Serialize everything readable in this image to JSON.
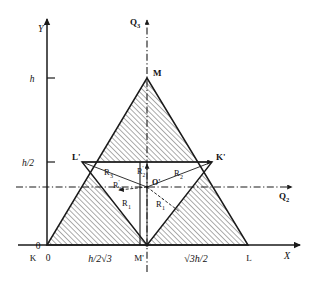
{
  "figure": {
    "name": "triangular-cross-section-geometry-diagram",
    "type": "geometric-diagram",
    "background": "#ffffff",
    "line_color": "#1a1a1a",
    "hatch_color": "#333333"
  },
  "axes": {
    "x": {
      "label": "X",
      "arrow": true,
      "y_pixel": 245,
      "from_x": 18,
      "to_x": 305
    },
    "y": {
      "label": "Y",
      "arrow": true,
      "x_pixel": 47,
      "from_y": 245,
      "to_y": 14
    },
    "origin_label": "0"
  },
  "dashdot_axes": [
    {
      "label": "Q2",
      "label_display": "Q",
      "sub": "2",
      "orientation": "horizontal",
      "pixel": 187,
      "arrow": true
    },
    {
      "label": "Q3",
      "label_display": "Q",
      "sub": "3",
      "orientation": "vertical",
      "pixel": 147,
      "arrow": true
    }
  ],
  "tick_labels": {
    "y": [
      {
        "text": "h",
        "y_pixel": 78
      },
      {
        "text": "h/2",
        "y_pixel": 162
      },
      {
        "text": "0",
        "y_pixel": 245
      }
    ],
    "x": [
      {
        "text": "K",
        "x_pixel": 33
      },
      {
        "text": "0",
        "x_pixel": 47
      },
      {
        "text": "h/2√3",
        "x_pixel": 100
      },
      {
        "text": "M'",
        "x_pixel": 139
      },
      {
        "text": "√3h/2",
        "x_pixel": 196
      },
      {
        "text": "L",
        "x_pixel": 249
      },
      {
        "text": "X",
        "x_pixel": 288
      }
    ]
  },
  "points": [
    {
      "name": "K",
      "label": "K",
      "x": 47,
      "y": 245
    },
    {
      "name": "L",
      "label": "L",
      "x": 248,
      "y": 245
    },
    {
      "name": "M",
      "label": "M",
      "x": 147,
      "y": 78
    },
    {
      "name": "Lp",
      "label": "L'",
      "x": 82,
      "y": 162
    },
    {
      "name": "Kp",
      "label": "K'",
      "x": 212,
      "y": 162
    },
    {
      "name": "Mp",
      "label": "M'",
      "x": 147,
      "y": 245
    },
    {
      "name": "Op",
      "label": "O'",
      "x": 147,
      "y": 187
    }
  ],
  "radii_labels": [
    {
      "text": "R",
      "sub": "3",
      "prime": false,
      "x": 108,
      "y": 172
    },
    {
      "text": "R",
      "sub": "2",
      "prime": true,
      "x": 141,
      "y": 171
    },
    {
      "text": "R",
      "sub": "2",
      "prime": false,
      "x": 178,
      "y": 173
    },
    {
      "text": "R",
      "sub": "3",
      "prime": true,
      "x": 118,
      "y": 185
    },
    {
      "text": "R",
      "sub": "1",
      "prime": false,
      "x": 126,
      "y": 203
    },
    {
      "text": "R",
      "sub": "1",
      "prime": true,
      "x": 160,
      "y": 204
    }
  ],
  "shapes": {
    "outer_triangle": {
      "name": "outer-triangle-KLM",
      "vertices": "K,L,M",
      "hatched": true
    },
    "inner_triangle": {
      "name": "inner-inverted-triangle",
      "vertices": "L',K',M'",
      "hatched": false
    },
    "hatch_angle_deg": 45,
    "hatch_spacing_px": 2.6
  }
}
